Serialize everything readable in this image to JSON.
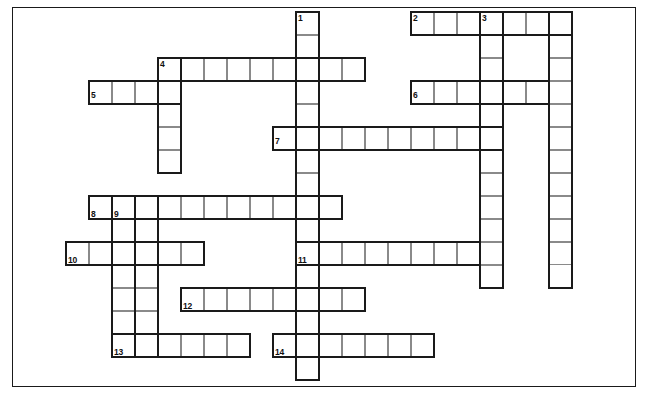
{
  "page": {
    "background_color": "#ffffff",
    "border_color": "#1a1a1a",
    "cell_fill_color": "#ffffff",
    "cell_line_color": "#8a8a8a",
    "entry_outline_color": "#1a1a1a",
    "width": 648,
    "height": 397
  },
  "grid": {
    "cell_size": 23,
    "origin_x": 66,
    "origin_y": 12,
    "columns": 25,
    "rows": 16
  },
  "clue_numbers": [
    {
      "label": "1",
      "x": 298,
      "y": 14
    },
    {
      "label": "2",
      "x": 413,
      "y": 14
    },
    {
      "label": "3",
      "x": 482,
      "y": 14
    },
    {
      "label": "4",
      "x": 160,
      "y": 60
    },
    {
      "label": "5",
      "x": 91,
      "y": 91
    },
    {
      "label": "6",
      "x": 413,
      "y": 91
    },
    {
      "label": "7",
      "x": 275,
      "y": 137
    },
    {
      "label": "8",
      "x": 91,
      "y": 210
    },
    {
      "label": "9",
      "x": 114,
      "y": 210
    },
    {
      "label": "10",
      "x": 68,
      "y": 256
    },
    {
      "label": "11",
      "x": 298,
      "y": 256
    },
    {
      "label": "12",
      "x": 183,
      "y": 302
    },
    {
      "label": "13",
      "x": 114,
      "y": 348
    },
    {
      "label": "14",
      "x": 275,
      "y": 348
    }
  ],
  "entries": [
    {
      "number": "1",
      "direction": "down",
      "col": 10,
      "row": 0,
      "length": 16
    },
    {
      "number": "2",
      "direction": "across",
      "col": 15,
      "row": 0,
      "length": 7
    },
    {
      "number": "3",
      "direction": "down",
      "col": 18,
      "row": 0,
      "length": 12
    },
    {
      "number": "3b",
      "direction": "down",
      "col": 21,
      "row": 0,
      "length": 12
    },
    {
      "number": "4",
      "direction": "across",
      "col": 4,
      "row": 2,
      "length": 9
    },
    {
      "number": "4d",
      "direction": "down",
      "col": 4,
      "row": 2,
      "length": 5
    },
    {
      "number": "5",
      "direction": "across",
      "col": 1,
      "row": 3,
      "length": 4
    },
    {
      "number": "6",
      "direction": "across",
      "col": 15,
      "row": 3,
      "length": 6
    },
    {
      "number": "7",
      "direction": "across",
      "col": 9,
      "row": 5,
      "length": 10
    },
    {
      "number": "8",
      "direction": "across",
      "col": 1,
      "row": 8,
      "length": 11
    },
    {
      "number": "9",
      "direction": "down",
      "col": 2,
      "row": 8,
      "length": 7
    },
    {
      "number": "9b",
      "direction": "down",
      "col": 3,
      "row": 8,
      "length": 7
    },
    {
      "number": "10",
      "direction": "across",
      "col": 0,
      "row": 10,
      "length": 6
    },
    {
      "number": "11",
      "direction": "across",
      "col": 10,
      "row": 10,
      "length": 8
    },
    {
      "number": "12",
      "direction": "across",
      "col": 5,
      "row": 12,
      "length": 8
    },
    {
      "number": "13",
      "direction": "across",
      "col": 2,
      "row": 14,
      "length": 6
    },
    {
      "number": "14",
      "direction": "across",
      "col": 9,
      "row": 14,
      "length": 7
    }
  ],
  "cells": [
    {
      "c": 10,
      "r": 0
    },
    {
      "c": 15,
      "r": 0
    },
    {
      "c": 16,
      "r": 0
    },
    {
      "c": 17,
      "r": 0
    },
    {
      "c": 18,
      "r": 0
    },
    {
      "c": 19,
      "r": 0
    },
    {
      "c": 20,
      "r": 0
    },
    {
      "c": 21,
      "r": 0
    },
    {
      "c": 10,
      "r": 1
    },
    {
      "c": 18,
      "r": 1
    },
    {
      "c": 21,
      "r": 1
    },
    {
      "c": 4,
      "r": 2
    },
    {
      "c": 5,
      "r": 2
    },
    {
      "c": 6,
      "r": 2
    },
    {
      "c": 7,
      "r": 2
    },
    {
      "c": 8,
      "r": 2
    },
    {
      "c": 9,
      "r": 2
    },
    {
      "c": 10,
      "r": 2
    },
    {
      "c": 11,
      "r": 2
    },
    {
      "c": 12,
      "r": 2
    },
    {
      "c": 18,
      "r": 2
    },
    {
      "c": 21,
      "r": 2
    },
    {
      "c": 1,
      "r": 3
    },
    {
      "c": 2,
      "r": 3
    },
    {
      "c": 3,
      "r": 3
    },
    {
      "c": 4,
      "r": 3
    },
    {
      "c": 10,
      "r": 3
    },
    {
      "c": 15,
      "r": 3
    },
    {
      "c": 16,
      "r": 3
    },
    {
      "c": 17,
      "r": 3
    },
    {
      "c": 18,
      "r": 3
    },
    {
      "c": 19,
      "r": 3
    },
    {
      "c": 20,
      "r": 3
    },
    {
      "c": 21,
      "r": 3
    },
    {
      "c": 4,
      "r": 4
    },
    {
      "c": 10,
      "r": 4
    },
    {
      "c": 18,
      "r": 4
    },
    {
      "c": 21,
      "r": 4
    },
    {
      "c": 4,
      "r": 5
    },
    {
      "c": 9,
      "r": 5
    },
    {
      "c": 10,
      "r": 5
    },
    {
      "c": 11,
      "r": 5
    },
    {
      "c": 12,
      "r": 5
    },
    {
      "c": 13,
      "r": 5
    },
    {
      "c": 14,
      "r": 5
    },
    {
      "c": 15,
      "r": 5
    },
    {
      "c": 16,
      "r": 5
    },
    {
      "c": 17,
      "r": 5
    },
    {
      "c": 18,
      "r": 5
    },
    {
      "c": 21,
      "r": 5
    },
    {
      "c": 4,
      "r": 6
    },
    {
      "c": 10,
      "r": 6
    },
    {
      "c": 18,
      "r": 6
    },
    {
      "c": 21,
      "r": 6
    },
    {
      "c": 10,
      "r": 7
    },
    {
      "c": 18,
      "r": 7
    },
    {
      "c": 21,
      "r": 7
    },
    {
      "c": 1,
      "r": 8
    },
    {
      "c": 2,
      "r": 8
    },
    {
      "c": 3,
      "r": 8
    },
    {
      "c": 4,
      "r": 8
    },
    {
      "c": 5,
      "r": 8
    },
    {
      "c": 6,
      "r": 8
    },
    {
      "c": 7,
      "r": 8
    },
    {
      "c": 8,
      "r": 8
    },
    {
      "c": 9,
      "r": 8
    },
    {
      "c": 10,
      "r": 8
    },
    {
      "c": 11,
      "r": 8
    },
    {
      "c": 18,
      "r": 8
    },
    {
      "c": 21,
      "r": 8
    },
    {
      "c": 2,
      "r": 9
    },
    {
      "c": 3,
      "r": 9
    },
    {
      "c": 10,
      "r": 9
    },
    {
      "c": 18,
      "r": 9
    },
    {
      "c": 21,
      "r": 9
    },
    {
      "c": 0,
      "r": 10
    },
    {
      "c": 1,
      "r": 10
    },
    {
      "c": 2,
      "r": 10
    },
    {
      "c": 3,
      "r": 10
    },
    {
      "c": 4,
      "r": 10
    },
    {
      "c": 5,
      "r": 10
    },
    {
      "c": 10,
      "r": 10
    },
    {
      "c": 11,
      "r": 10
    },
    {
      "c": 12,
      "r": 10
    },
    {
      "c": 13,
      "r": 10
    },
    {
      "c": 14,
      "r": 10
    },
    {
      "c": 15,
      "r": 10
    },
    {
      "c": 16,
      "r": 10
    },
    {
      "c": 17,
      "r": 10
    },
    {
      "c": 18,
      "r": 10
    },
    {
      "c": 21,
      "r": 10
    },
    {
      "c": 2,
      "r": 11
    },
    {
      "c": 3,
      "r": 11
    },
    {
      "c": 10,
      "r": 11
    },
    {
      "c": 18,
      "r": 11
    },
    {
      "c": 2,
      "r": 12
    },
    {
      "c": 3,
      "r": 12
    },
    {
      "c": 5,
      "r": 12
    },
    {
      "c": 6,
      "r": 12
    },
    {
      "c": 7,
      "r": 12
    },
    {
      "c": 8,
      "r": 12
    },
    {
      "c": 9,
      "r": 12
    },
    {
      "c": 10,
      "r": 12
    },
    {
      "c": 11,
      "r": 12
    },
    {
      "c": 12,
      "r": 12
    },
    {
      "c": 2,
      "r": 13
    },
    {
      "c": 3,
      "r": 13
    },
    {
      "c": 10,
      "r": 13
    },
    {
      "c": 2,
      "r": 14
    },
    {
      "c": 3,
      "r": 14
    },
    {
      "c": 4,
      "r": 14
    },
    {
      "c": 5,
      "r": 14
    },
    {
      "c": 6,
      "r": 14
    },
    {
      "c": 7,
      "r": 14
    },
    {
      "c": 9,
      "r": 14
    },
    {
      "c": 10,
      "r": 14
    },
    {
      "c": 11,
      "r": 14
    },
    {
      "c": 12,
      "r": 14
    },
    {
      "c": 13,
      "r": 14
    },
    {
      "c": 14,
      "r": 14
    },
    {
      "c": 15,
      "r": 14
    }
  ]
}
